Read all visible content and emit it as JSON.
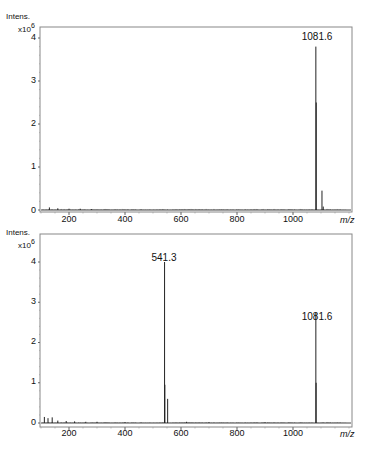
{
  "chart_data": [
    {
      "type": "line",
      "title": "",
      "ylabel": "Intens.",
      "ylabel_scale": "x10",
      "ylabel_exponent": "6",
      "xlabel": "m/z",
      "xlim": [
        100,
        1200
      ],
      "ylim": [
        0,
        4.3
      ],
      "x_ticks": [
        "200",
        "400",
        "600",
        "800",
        "1000"
      ],
      "y_ticks": [
        "0",
        "1",
        "2",
        "3",
        "4"
      ],
      "grid": false,
      "annotations": [
        {
          "label": "1081.6",
          "x": 1081.6,
          "y": 3.8
        }
      ],
      "peaks": [
        {
          "x": 1081.6,
          "y": 3.8
        },
        {
          "x": 1083.0,
          "y": 2.5
        },
        {
          "x": 1103.5,
          "y": 0.45
        },
        {
          "x": 1108.0,
          "y": 0.08
        },
        {
          "x": 130,
          "y": 0.06
        },
        {
          "x": 160,
          "y": 0.04
        },
        {
          "x": 200,
          "y": 0.03
        },
        {
          "x": 240,
          "y": 0.03
        },
        {
          "x": 280,
          "y": 0.02
        }
      ]
    },
    {
      "type": "line",
      "title": "",
      "ylabel": "Intens.",
      "ylabel_scale": "x10",
      "ylabel_exponent": "6",
      "xlabel": "m/z",
      "xlim": [
        100,
        1200
      ],
      "ylim": [
        0,
        4.3
      ],
      "x_ticks": [
        "200",
        "400",
        "600",
        "800",
        "1000"
      ],
      "y_ticks": [
        "0",
        "1",
        "2",
        "3",
        "4"
      ],
      "grid": false,
      "annotations": [
        {
          "label": "541.3",
          "x": 541.3,
          "y": 4.0
        },
        {
          "label": "1081.6",
          "x": 1081.6,
          "y": 2.75
        }
      ],
      "peaks": [
        {
          "x": 541.3,
          "y": 4.0
        },
        {
          "x": 542.3,
          "y": 0.95
        },
        {
          "x": 552.3,
          "y": 0.6
        },
        {
          "x": 1081.6,
          "y": 2.75
        },
        {
          "x": 1082.6,
          "y": 1.0
        },
        {
          "x": 112,
          "y": 0.15
        },
        {
          "x": 125,
          "y": 0.12
        },
        {
          "x": 140,
          "y": 0.14
        },
        {
          "x": 160,
          "y": 0.06
        },
        {
          "x": 190,
          "y": 0.05
        },
        {
          "x": 220,
          "y": 0.04
        },
        {
          "x": 260,
          "y": 0.03
        },
        {
          "x": 300,
          "y": 0.03
        },
        {
          "x": 400,
          "y": 0.02
        },
        {
          "x": 620,
          "y": 0.03
        },
        {
          "x": 700,
          "y": 0.02
        },
        {
          "x": 900,
          "y": 0.02
        }
      ]
    }
  ],
  "panels": [
    {
      "ylabel": "Intens.",
      "scale": "x10",
      "exp": "6",
      "xunit": "m/z",
      "peak_labels": [
        "1081.6"
      ]
    },
    {
      "ylabel": "Intens.",
      "scale": "x10",
      "exp": "6",
      "xunit": "m/z",
      "peak_labels": [
        "541.3",
        "1081.6"
      ]
    }
  ],
  "x_ticks": [
    "200",
    "400",
    "600",
    "800",
    "1000"
  ],
  "y_ticks": [
    "0",
    "1",
    "2",
    "3",
    "4"
  ]
}
